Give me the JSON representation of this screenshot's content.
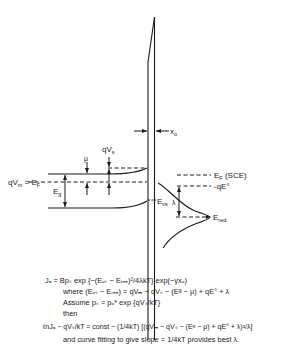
{
  "diagram": {
    "type": "energy-band diagram",
    "labels": {
      "qvm_ef": "qV",
      "qvm_ef_sub": "m",
      "qvm_ef_rest": " = E",
      "qvm_ef_sub2": "F",
      "eg": "E",
      "eg_sub": "g",
      "mu": "μ",
      "qvs": "qV",
      "qvs_sub": "s",
      "x0": "x",
      "x0_sub": "o",
      "ef_sce": "E",
      "ef_sce_sub": "F",
      "ef_sce_rest": " (SCE)",
      "qe0": "-qE°",
      "evs": "E",
      "evs_sub": "vs",
      "lambda": "λ",
      "ered": "E",
      "ered_sub": "red"
    },
    "equations": [
      "Jₐ = Bpₛ exp {−(Eᵥₛ − Eᵣₑₑ)²/4λkT} exp(−γxₒ)",
      "where (Eᵥₛ − Eᵣₑₑ) = qVₘ − qVₛ − (Eᵍ − μ) + qE° + λ",
      "Assume pₛ = pₒ* exp {qVₛ/kT}",
      "then",
      "ℓnJₐ − qVₛ/kT = const − (1/4kT) [(qVₘ − qVₛ − (Eᵍ − μ) + qE° + λ)²/λ]",
      "and curve fitting to give slope = 1/4kT provides best λ."
    ]
  }
}
